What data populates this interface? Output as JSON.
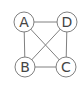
{
  "diagram": {
    "type": "complete-graph",
    "colors": {
      "stroke": "#808080",
      "node_fill": "#ffffff",
      "text": "#444444"
    },
    "nodes": [
      {
        "id": "A",
        "label": "A",
        "x": 24,
        "y": 22
      },
      {
        "id": "D",
        "label": "D",
        "x": 67,
        "y": 22
      },
      {
        "id": "B",
        "label": "B",
        "x": 25,
        "y": 67
      },
      {
        "id": "C",
        "label": "C",
        "x": 66,
        "y": 67
      }
    ],
    "edges": [
      [
        "A",
        "D"
      ],
      [
        "A",
        "B"
      ],
      [
        "A",
        "C"
      ],
      [
        "D",
        "B"
      ],
      [
        "D",
        "C"
      ],
      [
        "B",
        "C"
      ]
    ]
  }
}
